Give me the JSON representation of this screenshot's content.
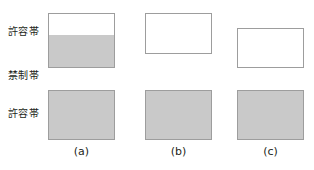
{
  "figure": {
    "background_color": "#ffffff",
    "fill_color": "#c9c9c9",
    "border_color": "#9d9d9d",
    "text_color": "#231f20",
    "band_labels": [
      {
        "text": "許容帯",
        "name": "allowed-band-upper-label",
        "x": 8,
        "y": 26
      },
      {
        "text": "禁制帯",
        "name": "forbidden-band-label",
        "x": 8,
        "y": 70
      },
      {
        "text": "許容帯",
        "name": "allowed-band-lower-label",
        "x": 8,
        "y": 108
      }
    ],
    "columns": [
      {
        "id": "a",
        "caption": "(a)",
        "caption_x": 48,
        "caption_y": 146,
        "caption_w": 67,
        "upper_box": {
          "x": 48,
          "y": 13,
          "w": 67,
          "h": 55,
          "fill_percent": 60,
          "fill_from": "bottom",
          "description": "partially-filled-upper-band"
        },
        "lower_box": {
          "x": 48,
          "y": 90,
          "w": 67,
          "h": 50,
          "fill_percent": 100,
          "fill_from": "bottom",
          "description": "filled-lower-band"
        }
      },
      {
        "id": "b",
        "caption": "(b)",
        "caption_x": 145,
        "caption_y": 146,
        "caption_w": 67,
        "upper_box": {
          "x": 145,
          "y": 13,
          "w": 67,
          "h": 41,
          "fill_percent": 0,
          "fill_from": "bottom",
          "description": "empty-upper-band"
        },
        "lower_box": {
          "x": 145,
          "y": 90,
          "w": 67,
          "h": 50,
          "fill_percent": 100,
          "fill_from": "bottom",
          "description": "filled-lower-band"
        }
      },
      {
        "id": "c",
        "caption": "(c)",
        "caption_x": 237,
        "caption_y": 146,
        "caption_w": 67,
        "upper_box": {
          "x": 237,
          "y": 28,
          "w": 67,
          "h": 40,
          "fill_percent": 0,
          "fill_from": "bottom",
          "description": "empty-upper-band-raised"
        },
        "lower_box": {
          "x": 237,
          "y": 90,
          "w": 67,
          "h": 50,
          "fill_percent": 100,
          "fill_from": "bottom",
          "description": "filled-lower-band"
        }
      }
    ]
  }
}
